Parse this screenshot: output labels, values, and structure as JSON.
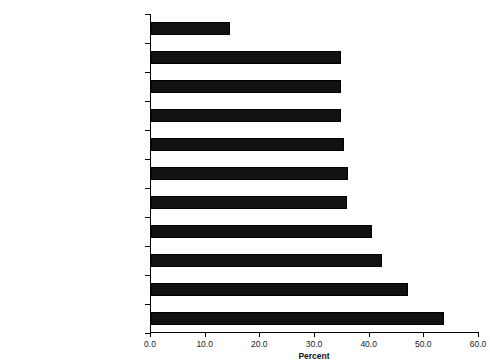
{
  "chart_data": {
    "type": "bar",
    "orientation": "horizontal",
    "title": "",
    "xlabel": "Percent",
    "ylabel": "",
    "xlim": [
      0.0,
      60.0
    ],
    "xticks": [
      "0.0",
      "10.0",
      "20.0",
      "30.0",
      "40.0",
      "50.0",
      "60.0"
    ],
    "xtick_values": [
      0,
      10,
      20,
      30,
      40,
      50,
      60
    ],
    "grid": false,
    "legend": null,
    "bar_color": "#111111",
    "categories": [
      "UNITED STATES",
      "San Francisco County, California",
      "Alameda County, California",
      "San Mateo County, California",
      "Middlesex County, New Jersey",
      "Kings County, New York",
      "Broward County, Florida",
      "Santa Clara County, California",
      "Hudson County, New Jersey",
      "Queens County, New York",
      "Miami-Dade County, Florida"
    ],
    "values": [
      14.4,
      34.7,
      34.7,
      34.8,
      35.3,
      36.0,
      35.8,
      40.4,
      42.2,
      47.0,
      53.6
    ]
  }
}
